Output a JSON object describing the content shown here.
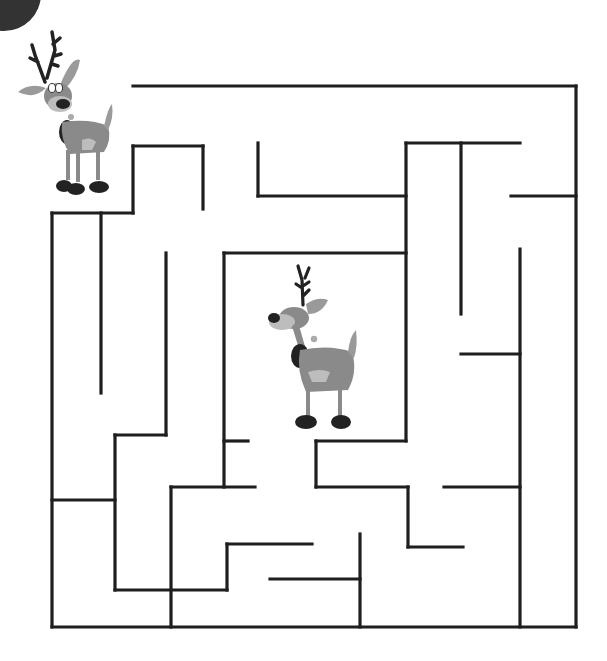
{
  "puzzle": {
    "type": "maze",
    "title": "Reindeer Maze",
    "start_character": "reindeer-start",
    "goal_character": "reindeer-goal"
  },
  "colors": {
    "wall": "#1e1e1e",
    "background": "#ffffff",
    "corner_circle": "#333333",
    "deer_body": "#8a8a8a",
    "deer_light": "#bdbdbd",
    "deer_dark": "#222222"
  },
  "corner_circle": {
    "cx": 4,
    "cy": -6,
    "r": 37
  },
  "walls": [
    [
      133,
      86,
      576,
      86
    ],
    [
      576,
      86,
      576,
      627
    ],
    [
      52,
      627,
      576,
      627
    ],
    [
      52,
      213,
      52,
      627
    ],
    [
      52,
      213,
      133,
      213
    ],
    [
      133,
      146,
      133,
      213
    ],
    [
      133,
      146,
      203,
      146
    ],
    [
      203,
      146,
      203,
      209
    ],
    [
      101,
      213,
      101,
      393
    ],
    [
      166,
      253,
      166,
      435
    ],
    [
      115,
      435,
      166,
      435
    ],
    [
      115,
      435,
      115,
      590
    ],
    [
      52,
      500,
      115,
      500
    ],
    [
      115,
      590,
      227,
      590
    ],
    [
      227,
      544,
      227,
      590
    ],
    [
      227,
      544,
      312,
      544
    ],
    [
      171,
      487,
      171,
      627
    ],
    [
      171,
      487,
      255,
      487
    ],
    [
      224,
      253,
      224,
      487
    ],
    [
      224,
      441,
      248,
      441
    ],
    [
      224,
      253,
      406,
      253
    ],
    [
      258,
      143,
      258,
      196
    ],
    [
      258,
      196,
      406,
      196
    ],
    [
      406,
      143,
      406,
      441
    ],
    [
      406,
      143,
      520,
      143
    ],
    [
      461,
      143,
      461,
      314
    ],
    [
      511,
      196,
      576,
      196
    ],
    [
      520,
      249,
      520,
      627
    ],
    [
      461,
      354,
      520,
      354
    ],
    [
      316,
      441,
      406,
      441
    ],
    [
      316,
      441,
      316,
      487
    ],
    [
      316,
      487,
      408,
      487
    ],
    [
      408,
      487,
      408,
      547
    ],
    [
      408,
      547,
      463,
      547
    ],
    [
      444,
      487,
      520,
      487
    ],
    [
      360,
      534,
      360,
      627
    ],
    [
      270,
      579,
      360,
      579
    ]
  ]
}
